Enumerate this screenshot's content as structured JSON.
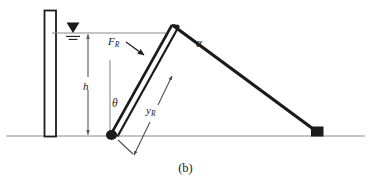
{
  "figure": {
    "caption": "(b)",
    "labels": {
      "resultant_force": "F",
      "resultant_force_sub": "R",
      "apex_angle": "α",
      "gate_angle": "θ",
      "pressure_center_depth": "y",
      "pressure_center_depth_sub": "R",
      "water_depth": "h"
    },
    "icons": {
      "water_surface": "water-table-triangle-icon",
      "hinge": "hinge-pivot-icon",
      "support": "support-block-icon",
      "dimension_arrow": "double-headed-arrow-icon",
      "leader_arrow": "leader-arrow-icon"
    },
    "colors": {
      "ink": "#1b1b1b",
      "thin_line": "#8a8a8a",
      "fill": "#ffffff",
      "background": "#ffffff"
    },
    "geometry": {
      "wall": {
        "x": 44,
        "y": 10,
        "width": 12,
        "height": 130
      },
      "ground_line_y": 136,
      "water_line_y": 33,
      "water_line_x1": 52,
      "water_line_x2": 165,
      "water_symbol_x": 73,
      "hinge": {
        "x": 110,
        "y": 136
      },
      "apex": {
        "x": 172,
        "y": 25
      },
      "support_block": {
        "x": 318,
        "y": 136
      },
      "h_dimension_x": 88,
      "theta_reference_line": {
        "x": 110,
        "y1": 60,
        "y2": 136
      }
    }
  }
}
